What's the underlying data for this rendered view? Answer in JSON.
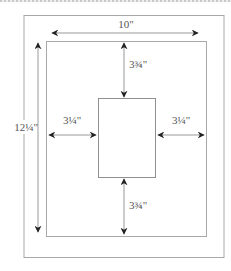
{
  "diagram": {
    "colors": {
      "frame": "#a0a0a0",
      "arrow": "#444444",
      "label": "#555555"
    },
    "outer_frame": {
      "width_label": "10\"",
      "height_label": "12¼\""
    },
    "margins": {
      "top": "3¾\"",
      "bottom": "3¾\"",
      "left": "3¼\"",
      "right": "3¼\""
    }
  }
}
